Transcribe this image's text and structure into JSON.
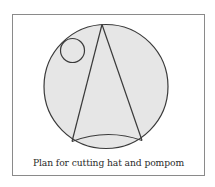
{
  "figure": {
    "caption": "Plan for cutting hat and pompom",
    "colors": {
      "fill": "#e6e6e6",
      "stroke": "#3a3a3a",
      "frame": "#8a8a8a",
      "background": "#ffffff"
    },
    "shapes": {
      "outer_circle": {
        "label": "fabric circle",
        "cx": 106,
        "cy": 86.5,
        "r": 62
      },
      "pompom_circle": {
        "label": "pompom",
        "cx": 72.5,
        "cy": 50.5,
        "r": 12
      },
      "hat_cone": {
        "label": "hat",
        "apex": [
          102,
          24.5
        ],
        "base_left": [
          72,
          141.5
        ],
        "base_right": [
          142,
          140.5
        ],
        "arc_peak_y": 135
      }
    }
  }
}
